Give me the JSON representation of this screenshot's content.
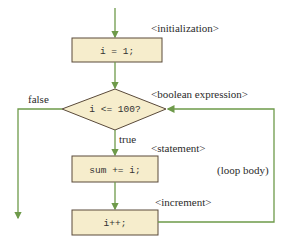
{
  "diagram": {
    "type": "flowchart",
    "colors": {
      "line": "#6e9a4a",
      "box_fill": "#f6edcc",
      "box_border": "#5a4a3a",
      "text": "#2b2b2b"
    },
    "nodes": [
      {
        "id": "init",
        "shape": "rect",
        "text": "i = 1;",
        "annotation": "<initialization>"
      },
      {
        "id": "cond",
        "shape": "diamond",
        "text": "i <= 100?",
        "annotation": "<boolean expression>"
      },
      {
        "id": "stmt",
        "shape": "rect",
        "text": "sum += i;",
        "annotation": "<statement>"
      },
      {
        "id": "incr",
        "shape": "rect",
        "text": "i++;",
        "annotation": "<increment>"
      }
    ],
    "edges": [
      {
        "from": "start",
        "to": "init",
        "label": ""
      },
      {
        "from": "init",
        "to": "cond",
        "label": ""
      },
      {
        "from": "cond",
        "to": "stmt",
        "label": "true"
      },
      {
        "from": "cond",
        "to": "exit",
        "label": "false"
      },
      {
        "from": "stmt",
        "to": "incr",
        "label": ""
      },
      {
        "from": "incr",
        "to": "cond",
        "label": ""
      }
    ],
    "loop_label": "(loop body)"
  }
}
